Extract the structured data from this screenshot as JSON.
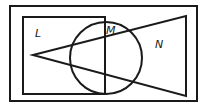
{
  "diagram": {
    "type": "venn",
    "universal_set": "rectangle",
    "sets": [
      {
        "name": "L",
        "shape": "rectangle",
        "label": "L"
      },
      {
        "name": "M",
        "shape": "circle",
        "label": "M"
      },
      {
        "name": "N",
        "shape": "triangle",
        "label": "N"
      }
    ]
  }
}
